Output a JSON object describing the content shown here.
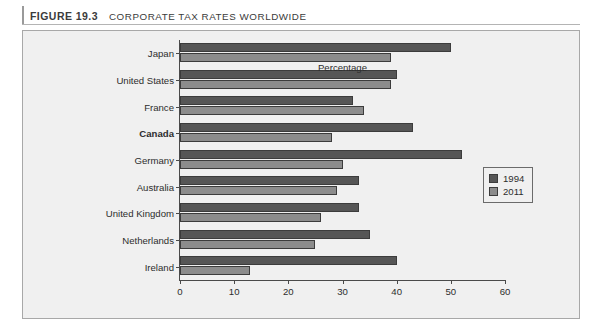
{
  "caption": {
    "figure_number": "FIGURE 19.3",
    "title": "CORPORATE TAX RATES WORLDWIDE"
  },
  "legend": {
    "items": [
      {
        "label": "1994",
        "color": "#565656"
      },
      {
        "label": "2011",
        "color": "#8c8c8c"
      }
    ]
  },
  "chart_data": {
    "type": "bar",
    "orientation": "horizontal",
    "title": "CORPORATE TAX RATES WORLDWIDE",
    "xlabel": "Percentage",
    "ylabel": "",
    "xlim": [
      0,
      60
    ],
    "xticks": [
      0,
      10,
      20,
      30,
      40,
      50,
      60
    ],
    "grid": false,
    "legend_position": "middle-right",
    "highlighted_category": "Canada",
    "categories": [
      "Japan",
      "United States",
      "France",
      "Canada",
      "Germany",
      "Australia",
      "United Kingdom",
      "Netherlands",
      "Ireland"
    ],
    "series": [
      {
        "name": "1994",
        "color": "#565656",
        "values": [
          50,
          40,
          32,
          43,
          52,
          33,
          33,
          35,
          40
        ]
      },
      {
        "name": "2011",
        "color": "#8c8c8c",
        "values": [
          39,
          39,
          34,
          28,
          30,
          29,
          26,
          25,
          13
        ]
      }
    ]
  }
}
